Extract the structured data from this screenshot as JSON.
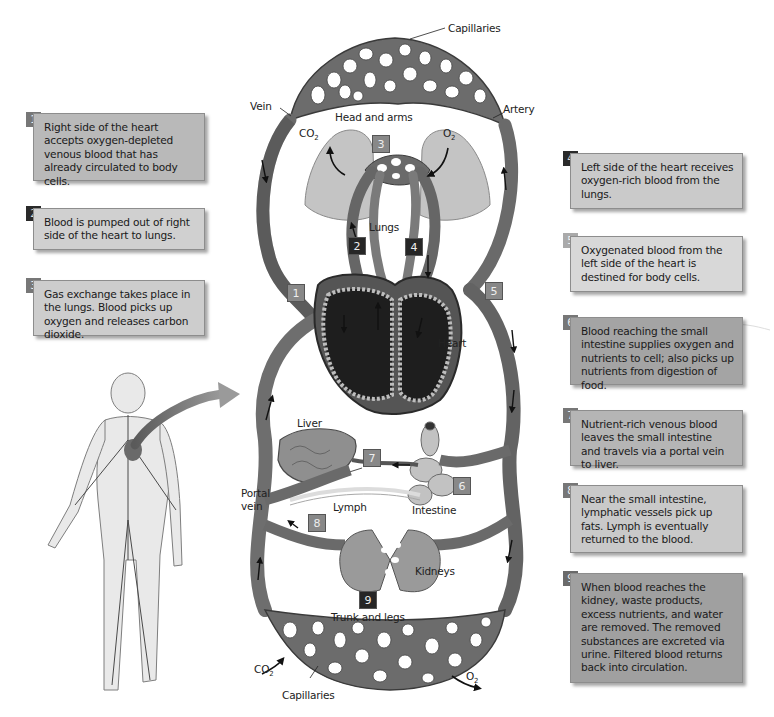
{
  "diagram": {
    "labels": {
      "capillaries_top": "Capillaries",
      "vein": "Vein",
      "artery": "Artery",
      "head_and_arms": "Head and arms",
      "co2_top": "CO",
      "co2_top_sub": "2",
      "o2_top": "O",
      "o2_top_sub": "2",
      "lungs": "Lungs",
      "heart": "Heart",
      "liver": "Liver",
      "portal_vein_line1": "Portal",
      "portal_vein_line2": "vein",
      "lymph": "Lymph",
      "intestine": "Intestine",
      "kidneys": "Kidneys",
      "trunk_and_legs": "Trunk and legs",
      "co2_bottom": "CO",
      "co2_bottom_sub": "2",
      "o2_bottom": "O",
      "o2_bottom_sub": "2",
      "capillaries_bottom": "Capillaries"
    },
    "markers": [
      "1",
      "2",
      "3",
      "4",
      "5",
      "6",
      "7",
      "8",
      "9"
    ],
    "colors": {
      "vessel": "#6a6a6a",
      "vessel_dark": "#3c3c3c",
      "organ": "#b5b5b5",
      "heart_interior": "#1e1e1e"
    }
  },
  "steps": [
    {
      "number": "1",
      "text": "Right side of the heart accepts oxygen-depleted venous blood that has already circulated to body cells.",
      "bg": "#b9b9b9"
    },
    {
      "number": "2",
      "text": "Blood is pumped out of right side of the heart to lungs.",
      "bg": "#d0d0d0"
    },
    {
      "number": "3",
      "text": "Gas exchange takes place in the lungs. Blood picks up oxygen and releases carbon dioxide.",
      "bg": "#cdcdcd"
    },
    {
      "number": "4",
      "text": "Left side of the heart receives oxygen-rich blood from the lungs.",
      "bg": "#cacaca"
    },
    {
      "number": "5",
      "text": "Oxygenated blood from the left side of the heart is destined for body cells.",
      "bg": "#d8d8d8"
    },
    {
      "number": "6",
      "text": "Blood reaching the small intestine supplies oxygen and nutrients to cell; also picks up nutrients from digestion of food.",
      "bg": "#a4a4a4"
    },
    {
      "number": "7",
      "text": "Nutrient-rich venous blood leaves the small intestine and travels via a portal vein to liver.",
      "bg": "#b5b5b5"
    },
    {
      "number": "8",
      "text": "Near the small intestine, lymphatic vessels pick up fats. Lymph is eventually returned to the blood.",
      "bg": "#c9c9c9"
    },
    {
      "number": "9",
      "text": "When blood reaches the kidney, waste products, excess nutrients, and water are removed. The removed substances are excreted via urine. Filtered blood returns back into circulation.",
      "bg": "#a0a0a0"
    }
  ]
}
